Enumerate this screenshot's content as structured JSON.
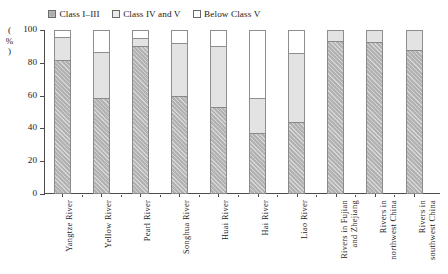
{
  "chart_data": {
    "type": "bar",
    "subtype": "stacked-vertical",
    "title": "",
    "xlabel": "",
    "ylabel": "(%)",
    "ylim": [
      0,
      100
    ],
    "yticks": [
      0,
      20,
      40,
      60,
      80,
      100
    ],
    "ytick_labels": [
      "0",
      "20",
      "40",
      "60",
      "80",
      "100"
    ],
    "grid": false,
    "legend_position": "top",
    "categories": [
      "Yangtze River",
      "Yellow River",
      "Pearl River",
      "Songhua River",
      "Huai River",
      "Hai River",
      "Liao River",
      "Rivers in Fujian and Zhejiang",
      "Rivers in northwest China",
      "Rivers in southwest China"
    ],
    "category_lines": [
      [
        "Yangtze River"
      ],
      [
        "Yellow River"
      ],
      [
        "Pearl River"
      ],
      [
        "Songhua River"
      ],
      [
        "Huai River"
      ],
      [
        "Hai River"
      ],
      [
        "Liao River"
      ],
      [
        "Rivers in Fujian",
        "and Zhejiang"
      ],
      [
        "Rivers in",
        "northwest China"
      ],
      [
        "Rivers in",
        "southwest China"
      ]
    ],
    "series": [
      {
        "name": "Class I–III",
        "color": "#b0b0b0",
        "values": [
          82,
          58.5,
          90,
          60,
          53,
          37,
          44,
          93,
          92.5,
          88
        ]
      },
      {
        "name": "Class IV and V",
        "color": "#e3e3e3",
        "values": [
          14,
          28,
          5,
          32,
          37,
          21.5,
          42,
          7,
          7.5,
          12
        ]
      },
      {
        "name": "Below Class V",
        "color": "#ffffff",
        "values": [
          4,
          13.5,
          5,
          8,
          10,
          41.5,
          14,
          0,
          0,
          0
        ]
      }
    ]
  },
  "legend": {
    "items": [
      {
        "label": "Class I–III",
        "swatch": "class-i-iii"
      },
      {
        "label": "Class IV and V",
        "swatch": "class-iv-v"
      },
      {
        "label": "Below Class V",
        "swatch": "below-class-v"
      }
    ]
  },
  "axes": {
    "y_axis_label": "(%)"
  }
}
